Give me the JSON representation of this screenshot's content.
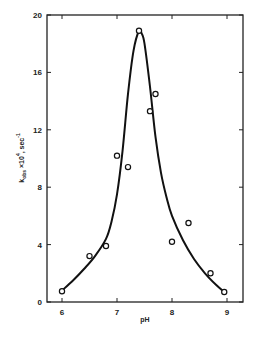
{
  "chart_data": {
    "type": "scatter",
    "title": "",
    "xlabel": "pH",
    "ylabel": "k_obs ×10^4, sec^-1",
    "xlim": [
      5.7,
      9.3
    ],
    "ylim": [
      0,
      20
    ],
    "xticks": [
      6,
      7,
      8,
      9
    ],
    "yticks": [
      0,
      4,
      8,
      12,
      16,
      20
    ],
    "grid": false,
    "legend": null,
    "series": [
      {
        "name": "observed",
        "marker": "open-circle",
        "x": [
          6.0,
          6.5,
          6.8,
          7.0,
          7.2,
          7.4,
          7.6,
          7.7,
          8.0,
          8.3,
          8.7,
          8.95
        ],
        "y": [
          0.75,
          3.2,
          3.9,
          10.2,
          9.4,
          18.9,
          13.3,
          14.5,
          4.2,
          5.5,
          2.0,
          0.7
        ]
      },
      {
        "name": "fitted curve",
        "style": "line",
        "x": [
          6.0,
          6.2,
          6.4,
          6.6,
          6.8,
          6.9,
          7.0,
          7.1,
          7.2,
          7.3,
          7.4,
          7.45,
          7.5,
          7.6,
          7.7,
          7.8,
          7.9,
          8.0,
          8.2,
          8.4,
          8.6,
          8.8,
          8.95
        ],
        "y": [
          0.8,
          1.5,
          2.3,
          3.2,
          4.4,
          5.6,
          7.5,
          10.5,
          14.5,
          17.5,
          18.9,
          18.7,
          18.0,
          15.0,
          11.5,
          9.0,
          7.3,
          6.0,
          4.3,
          3.0,
          2.0,
          1.2,
          0.7
        ]
      }
    ]
  },
  "labels": {
    "x_axis": "pH",
    "y_axis_main": "k",
    "y_axis_sub": "obs",
    "y_axis_rest": " ×10",
    "y_axis_exp": "4",
    "y_axis_unit": ", sec",
    "y_axis_unit_exp": "-1"
  }
}
